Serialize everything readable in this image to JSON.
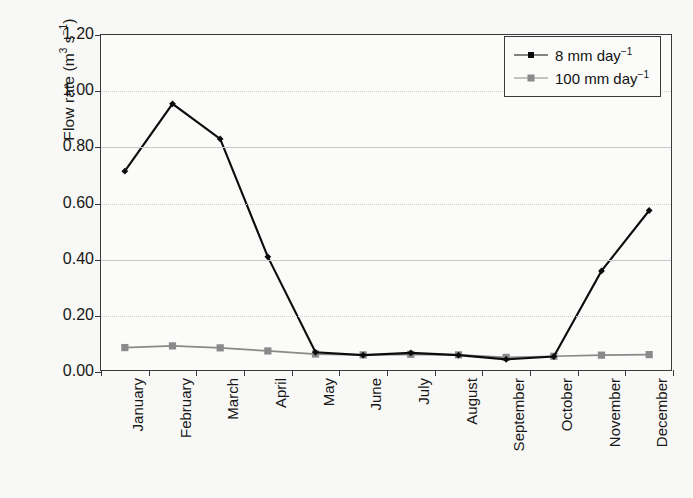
{
  "chart_data": {
    "type": "line",
    "title": "",
    "xlabel": "",
    "ylabel": "Flow rate (m3 s-1)",
    "ylabel_parts": {
      "prefix": "Flow rate (m",
      "sup1": "3",
      "mid": " s",
      "sup2": "−1",
      "suffix": ")"
    },
    "categories": [
      "January",
      "February",
      "March",
      "April",
      "May",
      "June",
      "July",
      "August",
      "September",
      "October",
      "November",
      "December"
    ],
    "ylim": [
      0.0,
      1.2
    ],
    "ytick_values": [
      0.0,
      0.2,
      0.4,
      0.6,
      0.8,
      1.0,
      1.2
    ],
    "ytick_labels": [
      "0.00",
      "0.20",
      "0.40",
      "0.60",
      "0.80",
      "1.00",
      "1.20"
    ],
    "grid": true,
    "grid_axis": "y",
    "legend_position": "top-right",
    "series": [
      {
        "name": "8 mm day-1",
        "name_parts": {
          "text": "8 mm day",
          "sup": "−1"
        },
        "color": "#0c0c0c",
        "marker": "diamond",
        "values": [
          0.715,
          0.955,
          0.83,
          0.41,
          0.07,
          0.06,
          0.068,
          0.06,
          0.045,
          0.055,
          0.36,
          0.575
        ]
      },
      {
        "name": "100 mm day-1",
        "name_parts": {
          "text": "100 mm day",
          "sup": "−1"
        },
        "color": "#8a8a8a",
        "marker": "square",
        "values": [
          0.087,
          0.093,
          0.086,
          0.075,
          0.064,
          0.061,
          0.063,
          0.061,
          0.052,
          0.056,
          0.06,
          0.062
        ]
      }
    ]
  },
  "axis": {
    "frame_color": "#3a3a3a",
    "grid_color": "#c9c9c9",
    "background": "#fbfbf9"
  }
}
